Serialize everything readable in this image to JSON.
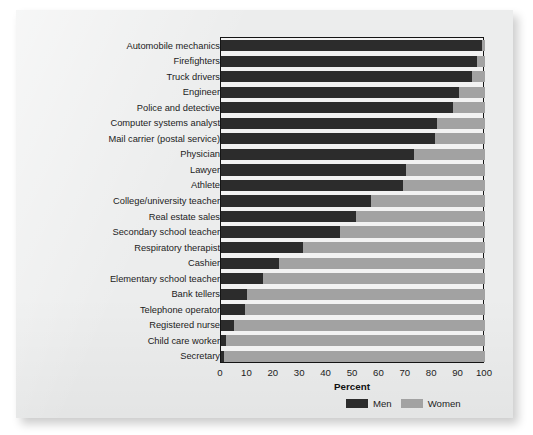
{
  "chart_data": {
    "type": "bar",
    "orientation": "horizontal",
    "stacked": true,
    "title": "",
    "xlabel": "Percent",
    "ylabel": "",
    "xlim": [
      0,
      100
    ],
    "xticks": [
      0,
      10,
      20,
      30,
      40,
      50,
      60,
      70,
      80,
      90,
      100
    ],
    "grid": false,
    "legend_position": "bottom-right",
    "colors": {
      "men": "#2c2c2c",
      "women": "#a2a2a2",
      "plot_background": "#f2f2f2",
      "page_background": "#eceded"
    },
    "categories": [
      "Automobile mechanics",
      "Firefighters",
      "Truck drivers",
      "Engineer",
      "Police and detective",
      "Computer systems analyst",
      "Mail carrier (postal service)",
      "Physician",
      "Lawyer",
      "Athlete",
      "College/university teacher",
      "Real estate sales",
      "Secondary school teacher",
      "Respiratory therapist",
      "Cashier",
      "Elementary school teacher",
      "Bank tellers",
      "Telephone operator",
      "Registered nurse",
      "Child care worker",
      "Secretary"
    ],
    "series": [
      {
        "name": "Men",
        "values": [
          99,
          97,
          95,
          90,
          88,
          82,
          81,
          73,
          70,
          69,
          57,
          51,
          45,
          31,
          22,
          16,
          10,
          9,
          5,
          2,
          1
        ]
      },
      {
        "name": "Women",
        "values": [
          1,
          3,
          5,
          10,
          12,
          18,
          19,
          27,
          30,
          31,
          43,
          49,
          55,
          69,
          78,
          84,
          90,
          91,
          95,
          98,
          99
        ]
      }
    ]
  },
  "legend": {
    "men_label": "Men",
    "women_label": "Women"
  },
  "axis": {
    "xlabel": "Percent"
  }
}
